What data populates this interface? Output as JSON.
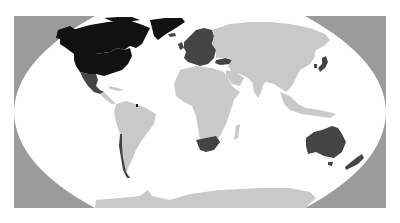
{
  "map": {
    "projection": "robinson",
    "title": "",
    "legend": [],
    "colors": {
      "frame": "#9b9b9b",
      "ocean": "#ffffff",
      "land_default": "#c9c9c9",
      "category_black": "#111111",
      "category_dark": "#444444"
    },
    "regions": [
      {
        "name": "Canada",
        "category": "category_black"
      },
      {
        "name": "United States",
        "category": "category_black"
      },
      {
        "name": "Alaska",
        "category": "category_black"
      },
      {
        "name": "Greenland",
        "category": "category_black"
      },
      {
        "name": "Mexico",
        "category": "category_dark"
      },
      {
        "name": "Iceland",
        "category": "category_dark"
      },
      {
        "name": "Europe",
        "category": "category_dark"
      },
      {
        "name": "Turkey",
        "category": "category_dark"
      },
      {
        "name": "Japan",
        "category": "category_dark"
      },
      {
        "name": "South Korea",
        "category": "category_dark"
      },
      {
        "name": "Chile",
        "category": "category_dark"
      },
      {
        "name": "French Guiana",
        "category": "category_black"
      },
      {
        "name": "South Africa",
        "category": "category_dark"
      },
      {
        "name": "Australia",
        "category": "category_dark"
      },
      {
        "name": "Tasmania",
        "category": "category_dark"
      },
      {
        "name": "New Zealand",
        "category": "category_dark"
      },
      {
        "name": "South America",
        "category": "land_default"
      },
      {
        "name": "Africa",
        "category": "land_default"
      },
      {
        "name": "Asia",
        "category": "land_default"
      },
      {
        "name": "Central America",
        "category": "land_default"
      },
      {
        "name": "Caribbean",
        "category": "land_default"
      },
      {
        "name": "Madagascar",
        "category": "land_default"
      },
      {
        "name": "Southeast Asia",
        "category": "land_default"
      },
      {
        "name": "Antarctica",
        "category": "land_default"
      }
    ]
  }
}
